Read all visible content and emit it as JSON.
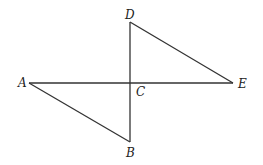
{
  "diagram": {
    "type": "geometry",
    "points": {
      "A": {
        "label": "A",
        "x": 29,
        "y": 83,
        "lx": 18,
        "ly": 87
      },
      "B": {
        "label": "B",
        "x": 130,
        "y": 142,
        "lx": 126,
        "ly": 157
      },
      "C": {
        "label": "C",
        "x": 130,
        "y": 83,
        "lx": 136,
        "ly": 96
      },
      "D": {
        "label": "D",
        "x": 130,
        "y": 22,
        "lx": 125,
        "ly": 19
      },
      "E": {
        "label": "E",
        "x": 233,
        "y": 83,
        "lx": 238,
        "ly": 88
      }
    },
    "segments": [
      [
        "A",
        "E"
      ],
      [
        "D",
        "B"
      ],
      [
        "A",
        "B"
      ],
      [
        "D",
        "E"
      ]
    ],
    "stroke_color": "#333333"
  }
}
